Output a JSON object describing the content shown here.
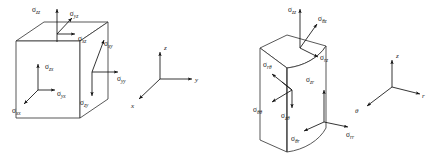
{
  "figure": {
    "title": "",
    "background_color": "#ffffff",
    "line_color": "#3a3a3a",
    "arrow_color": "#111111",
    "text_color": "#1a1a1a"
  },
  "panels": [
    {
      "id": "cartesian",
      "name": "cartesian-stress-element",
      "shape": "cube",
      "stress_components": [
        {
          "key": "szz",
          "sigma": "σ",
          "sub": "zz",
          "face": "top",
          "direction": "up",
          "label_x": 36,
          "label_y": 12
        },
        {
          "key": "syz",
          "sigma": "σ",
          "sub": "yz",
          "face": "top",
          "direction": "up-right-axon",
          "label_x": 74,
          "label_y": 16
        },
        {
          "key": "sxz",
          "sigma": "σ",
          "sub": "xz",
          "face": "top",
          "direction": "right",
          "label_x": 78,
          "label_y": 41
        },
        {
          "key": "szx",
          "sigma": "σ",
          "sub": "zx",
          "face": "front",
          "direction": "up",
          "label_x": 48,
          "label_y": 69
        },
        {
          "key": "syx",
          "sigma": "σ",
          "sub": "yx",
          "face": "front",
          "direction": "right",
          "label_x": 56,
          "label_y": 96
        },
        {
          "key": "sxx",
          "sigma": "σ",
          "sub": "xx",
          "face": "front",
          "direction": "down-left-axon",
          "label_x": 16,
          "label_y": 113
        },
        {
          "key": "sxy",
          "sigma": "σ",
          "sub": "xy",
          "face": "right",
          "direction": "up-right-axon",
          "label_x": 105,
          "label_y": 46
        },
        {
          "key": "syy",
          "sigma": "σ",
          "sub": "yy",
          "face": "right",
          "direction": "right",
          "label_x": 120,
          "label_y": 74
        },
        {
          "key": "szy",
          "sigma": "σ",
          "sub": "zy",
          "face": "right",
          "direction": "down",
          "label_x": 84,
          "label_y": 102
        }
      ],
      "axes": {
        "name": "cartesian-axes-triad",
        "origin_label": "",
        "items": [
          {
            "key": "z",
            "label": "z",
            "direction": "up",
            "label_x": 132,
            "label_y": 48
          },
          {
            "key": "y",
            "label": "y",
            "direction": "right",
            "label_x": 196,
            "label_y": 79
          },
          {
            "key": "x",
            "label": "x",
            "direction": "down-left-axon",
            "label_x": 129,
            "label_y": 103
          }
        ]
      }
    },
    {
      "id": "cylindrical",
      "name": "cylindrical-stress-element",
      "shape": "cylindrical-wedge",
      "stress_components": [
        {
          "key": "szz",
          "sigma": "σ",
          "sub": "zz",
          "face": "top",
          "direction": "up",
          "label_x": 292,
          "label_y": 12
        },
        {
          "key": "sthz",
          "sigma": "σ",
          "sub": "θz",
          "face": "top",
          "direction": "up-right-axon",
          "label_x": 319,
          "label_y": 20
        },
        {
          "key": "srz",
          "sigma": "σ",
          "sub": "rz",
          "face": "top",
          "direction": "down-right",
          "label_x": 320,
          "label_y": 50
        },
        {
          "key": "srth",
          "sigma": "σ",
          "sub": "rθ",
          "face": "left",
          "direction": "up-left-axon",
          "label_x": 271,
          "label_y": 68
        },
        {
          "key": "sthth",
          "sigma": "σ",
          "sub": "θθ",
          "face": "left",
          "direction": "down-left-axon",
          "label_x": 260,
          "label_y": 105
        },
        {
          "key": "szth",
          "sigma": "σ",
          "sub": "zθ",
          "face": "left",
          "direction": "down",
          "label_x": 287,
          "label_y": 113
        },
        {
          "key": "szr",
          "sigma": "σ",
          "sub": "zr",
          "face": "curved",
          "direction": "up",
          "label_x": 312,
          "label_y": 79
        },
        {
          "key": "sthr",
          "sigma": "σ",
          "sub": "θr",
          "face": "curved",
          "direction": "down-left-axon",
          "label_x": 296,
          "label_y": 133
        },
        {
          "key": "srr",
          "sigma": "σ",
          "sub": "rr",
          "face": "curved",
          "direction": "right",
          "label_x": 351,
          "label_y": 130
        }
      ],
      "axes": {
        "name": "cylindrical-axes-triad",
        "origin_label": "",
        "items": [
          {
            "key": "z",
            "label": "z",
            "direction": "up",
            "label_x": 392,
            "label_y": 56
          },
          {
            "key": "r",
            "label": "r",
            "direction": "right",
            "label_x": 424,
            "label_y": 97
          },
          {
            "key": "theta",
            "label": "θ",
            "direction": "down-left-axon",
            "label_x": 357,
            "label_y": 111
          }
        ]
      }
    }
  ]
}
